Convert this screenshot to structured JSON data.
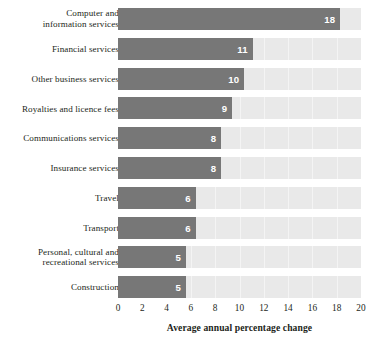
{
  "chart_data": {
    "type": "bar",
    "orientation": "horizontal",
    "title": "",
    "subtitle": "",
    "xlabel": "Average annual percentage change",
    "ylabel": "",
    "xlim": [
      0,
      20
    ],
    "xticks": [
      0,
      2,
      4,
      6,
      8,
      10,
      12,
      14,
      16,
      18,
      20
    ],
    "xtick_labels": [
      "0",
      "2",
      "4",
      "6",
      "8",
      "10",
      "12",
      "14",
      "16",
      "18",
      "20"
    ],
    "grid": true,
    "legend": false,
    "categories": [
      "Computer and\ninformation services",
      "Financial services",
      "Other business services",
      "Royalties and licence fees",
      "Communications services",
      "Insurance services",
      "Travel",
      "Transport",
      "Personal, cultural and\nrecreational services",
      "Construction"
    ],
    "values": [
      18,
      11,
      10,
      9,
      8,
      8,
      6,
      6,
      5,
      5
    ],
    "bar_extents": [
      18.3,
      11.1,
      10.4,
      9.4,
      8.5,
      8.5,
      6.4,
      6.4,
      5.6,
      5.6
    ],
    "data_labels": [
      "18",
      "11",
      "10",
      "9",
      "8",
      "8",
      "6",
      "6",
      "5",
      "5"
    ],
    "colors": {
      "bar_fill": "#777777",
      "track_background": "#e9e9e9",
      "gridline": "#f4f4f4",
      "data_label_text": "#ffffff",
      "axis_text": "#231f20",
      "page_background": "#ffffff"
    }
  }
}
